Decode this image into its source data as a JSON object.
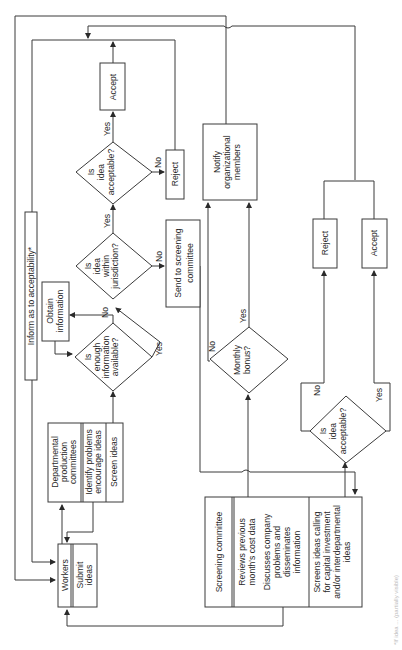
{
  "diagram": {
    "orientation": "rotated 90 degrees counter-clockwise",
    "nodes": {
      "accept_top": "Accept",
      "reject_top": "Reject",
      "decision_acceptable_top": [
        "Is",
        "idea",
        "acceptable?"
      ],
      "decision_jurisdiction": [
        "Is",
        "idea",
        "within",
        "jurisdiction?"
      ],
      "send_to_screening": [
        "Send to screening",
        "committee"
      ],
      "obtain_information": [
        "Obtain",
        "information"
      ],
      "decision_enough_info": [
        "Is",
        "enough",
        "information",
        "available?"
      ],
      "inform_acceptability": "Inform as to acceptability*",
      "departmental_committees": {
        "title": [
          "Departmental",
          "production",
          "committees"
        ],
        "tasks": [
          [
            "Identify problems",
            "encourage ideas"
          ],
          [
            "Screen  ideas"
          ]
        ]
      },
      "workers": {
        "title": "Workers",
        "tasks": [
          [
            "Submit",
            "ideas"
          ]
        ]
      },
      "notify_members": [
        "Notify",
        "organizational",
        "members"
      ],
      "decision_monthly_bonus": [
        "Monthly",
        "bonus?"
      ],
      "reject_right": "Reject",
      "accept_right": "Accept",
      "decision_acceptable_right": [
        "Is",
        "idea",
        "acceptable?"
      ],
      "screening_committee": {
        "title": "Screening committee",
        "tasks": [
          [
            "Reviews previous",
            "month's cost data"
          ],
          [
            "Discusses company",
            "problems and",
            "disseminates",
            "information"
          ],
          [
            "Screens ideas calling",
            "for capital investment",
            "and/or interdepartmental",
            "ideas"
          ]
        ]
      }
    },
    "edge_labels": {
      "yes": "Yes",
      "no": "No"
    },
    "caption_fragment": "*If idea ... (partially visible)"
  }
}
